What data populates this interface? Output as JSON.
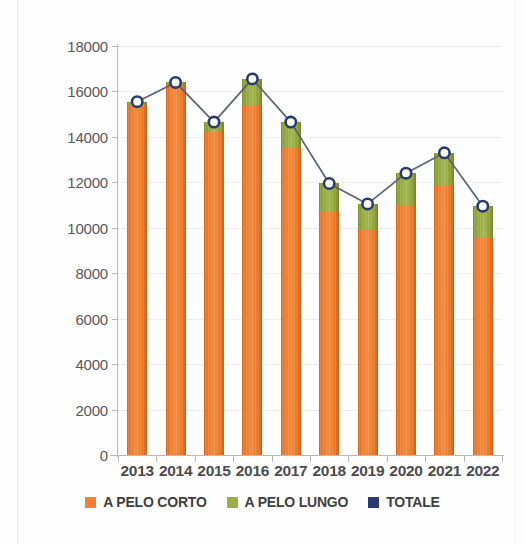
{
  "chart_data": {
    "type": "bar",
    "subtype": "stacked-bar-with-total-line",
    "title": "",
    "subtitle": "",
    "xlabel": "",
    "ylabel": "",
    "categories": [
      "2013",
      "2014",
      "2015",
      "2016",
      "2017",
      "2018",
      "2019",
      "2020",
      "2021",
      "2022"
    ],
    "series": [
      {
        "name": "A PELO CORTO",
        "type": "bar",
        "color": "#ef8235",
        "values": [
          15400,
          16300,
          14200,
          15400,
          13500,
          10750,
          9900,
          11000,
          11900,
          9550
        ]
      },
      {
        "name": "A PELO LUNGO",
        "type": "bar",
        "color": "#9cae46",
        "values": [
          150,
          100,
          450,
          1150,
          1150,
          1200,
          1150,
          1400,
          1400,
          1400
        ]
      },
      {
        "name": "TOTALE",
        "type": "line",
        "color": "#2a3b6e",
        "marker": "open-circle",
        "values": [
          15550,
          16400,
          14650,
          16550,
          14650,
          11950,
          11050,
          12400,
          13300,
          10950
        ]
      }
    ],
    "yticks": [
      0,
      2000,
      4000,
      6000,
      8000,
      10000,
      12000,
      14000,
      16000,
      18000
    ],
    "ytick_labels": [
      "0",
      "2000",
      "4000",
      "6000",
      "8000",
      "10000",
      "12000",
      "14000",
      "16000",
      "18000"
    ],
    "ylim": [
      0,
      18000
    ],
    "grid": true,
    "grid_axis": "y",
    "legend_position": "bottom",
    "legend": [
      "A PELO CORTO",
      "A PELO LUNGO",
      "TOTALE"
    ]
  },
  "axis": {
    "y_labels": [
      "18000",
      "16000",
      "14000",
      "12000",
      "10000",
      "8000",
      "6000",
      "4000",
      "2000",
      "0"
    ],
    "x_labels": [
      "2013",
      "2014",
      "2015",
      "2016",
      "2017",
      "2018",
      "2019",
      "2020",
      "2021",
      "2022"
    ]
  },
  "legend": {
    "items": [
      {
        "label": "A PELO CORTO",
        "color": "#ef8235",
        "icon": "square-swatch-icon"
      },
      {
        "label": "A PELO LUNGO",
        "color": "#9cae46",
        "icon": "square-swatch-icon"
      },
      {
        "label": "TOTALE",
        "color": "#2a3b6e",
        "icon": "square-swatch-icon"
      }
    ]
  },
  "colors": {
    "corto": "#ef8235",
    "lungo": "#9cae46",
    "totale": "#2a3b6e",
    "grid": "#f1eeea",
    "axis": "#b9b9b9",
    "tick_text": "#58585a",
    "category_text": "#4c4c4e"
  }
}
